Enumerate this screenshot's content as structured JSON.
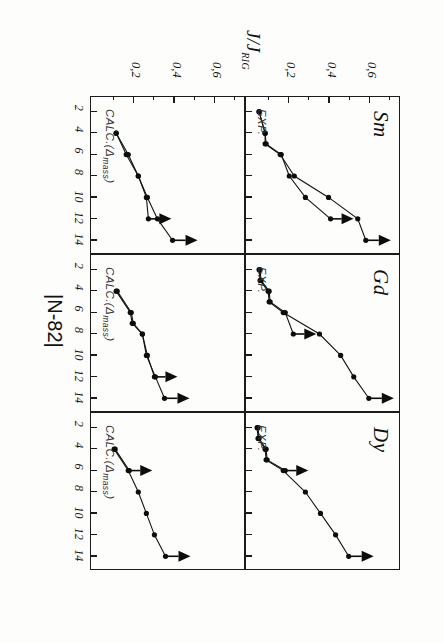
{
  "figure": {
    "rotation_degrees": 90,
    "ylabel": "J/J",
    "ylabel_sub": "RIG",
    "xlabel": "|N-82|",
    "row_labels": [
      "EXP.",
      "CALC.(Δmass)"
    ],
    "calc_label_main": "CALC.(Δ",
    "calc_label_sub": "mass",
    "calc_label_tail": ")",
    "exp_label": "EXP."
  },
  "chart_data": {
    "type": "line",
    "title": "",
    "xlabel": "|N-82|",
    "ylabel": "J/J_RIG",
    "xlim": [
      1,
      15
    ],
    "ylim": [
      0,
      0.72
    ],
    "xticks": [
      2,
      4,
      6,
      8,
      10,
      12,
      14
    ],
    "xticklabels": [
      "2",
      "4",
      "6",
      "8",
      "10",
      "12",
      "14"
    ],
    "yticks": [
      0.2,
      0.4,
      0.6
    ],
    "yticklabels": [
      "0,2",
      "0,4",
      "0,6"
    ],
    "grid": false,
    "legend": "none",
    "panels": [
      {
        "id": "sm-exp",
        "row": "EXP.",
        "column": "Sm",
        "title": "Sm",
        "row_label": "EXP.",
        "series": [
          {
            "name": "upper-branch",
            "marker": "filled-circle",
            "arrow": "left",
            "x": [
              2,
              4,
              5,
              6,
              8,
              10,
              12,
              14
            ],
            "values": [
              0.055,
              0.085,
              0.085,
              0.16,
              0.23,
              0.4,
              0.545,
              0.585
            ]
          },
          {
            "name": "lower-branch",
            "marker": "filled-circle",
            "arrow": "right",
            "x": [
              2,
              4,
              5,
              6,
              8,
              10,
              12
            ],
            "values": [
              0.055,
              0.085,
              0.09,
              0.165,
              0.205,
              0.285,
              0.41
            ]
          }
        ]
      },
      {
        "id": "gd-exp",
        "row": "EXP.",
        "column": "Gd",
        "title": "Gd",
        "row_label": "EXP.",
        "series": [
          {
            "name": "upper-branch",
            "marker": "filled-circle",
            "arrow": "left",
            "x": [
              2,
              3,
              4,
              5,
              6,
              8,
              10,
              12,
              14
            ],
            "values": [
              0.055,
              0.06,
              0.1,
              0.105,
              0.175,
              0.355,
              0.46,
              0.525,
              0.6
            ]
          },
          {
            "name": "lower-branch",
            "marker": "filled-circle",
            "arrow": "right",
            "x": [
              2,
              3,
              4,
              5,
              6,
              8
            ],
            "values": [
              0.06,
              0.065,
              0.105,
              0.11,
              0.185,
              0.225
            ]
          }
        ]
      },
      {
        "id": "dy-exp",
        "row": "EXP.",
        "column": "Dy",
        "title": "Dy",
        "row_label": "EXP.",
        "series": [
          {
            "name": "upper-branch",
            "marker": "filled-circle",
            "arrow": "left",
            "x": [
              2,
              3,
              4,
              5,
              6,
              8,
              10,
              12,
              14
            ],
            "values": [
              0.045,
              0.05,
              0.085,
              0.09,
              0.175,
              0.285,
              0.36,
              0.435,
              0.5
            ]
          },
          {
            "name": "lower-branch",
            "marker": "filled-circle",
            "arrow": "right",
            "x": [
              2,
              3,
              4,
              5,
              6
            ],
            "values": [
              0.05,
              0.055,
              0.09,
              0.095,
              0.185
            ]
          }
        ]
      },
      {
        "id": "sm-calc",
        "row": "CALC.(Δmass)",
        "column": "Sm",
        "title": "",
        "row_label": "CALC.(Δmass)",
        "series": [
          {
            "name": "upper-branch",
            "marker": "filled-circle",
            "arrow": "left",
            "x": [
              4,
              6,
              8,
              10,
              12,
              14
            ],
            "values": [
              0.115,
              0.165,
              0.225,
              0.27,
              0.32,
              0.395
            ]
          },
          {
            "name": "lower-branch",
            "marker": "filled-circle",
            "arrow": "right",
            "x": [
              4,
              6,
              8,
              10,
              12
            ],
            "values": [
              0.115,
              0.175,
              0.225,
              0.265,
              0.275
            ]
          }
        ]
      },
      {
        "id": "gd-calc",
        "row": "CALC.(Δmass)",
        "column": "Gd",
        "title": "",
        "row_label": "CALC.(Δmass)",
        "series": [
          {
            "name": "upper-branch",
            "marker": "filled-circle",
            "arrow": "left",
            "x": [
              4,
              6,
              7,
              8,
              10,
              12,
              14
            ],
            "values": [
              0.115,
              0.185,
              0.195,
              0.245,
              0.265,
              0.31,
              0.355
            ]
          },
          {
            "name": "lower-branch",
            "marker": "filled-circle",
            "arrow": "right",
            "x": [
              4,
              6,
              7,
              8,
              10,
              12
            ],
            "values": [
              0.12,
              0.19,
              0.2,
              0.245,
              0.27,
              0.305
            ]
          }
        ]
      },
      {
        "id": "dy-calc",
        "row": "CALC.(Δmass)",
        "column": "Dy",
        "title": "",
        "row_label": "CALC.(Δmass)",
        "series": [
          {
            "name": "upper-branch",
            "marker": "filled-circle",
            "arrow": "left",
            "x": [
              4,
              6,
              8,
              10,
              12,
              14
            ],
            "values": [
              0.105,
              0.175,
              0.225,
              0.265,
              0.305,
              0.36
            ]
          },
          {
            "name": "lower-branch",
            "marker": "filled-circle",
            "arrow": "right",
            "x": [
              4,
              6
            ],
            "values": [
              0.11,
              0.18
            ]
          }
        ]
      }
    ]
  },
  "panel_titles": {
    "sm": "Sm",
    "gd": "Gd",
    "dy": "Dy"
  },
  "ticks": {
    "x": [
      "2",
      "4",
      "6",
      "8",
      "10",
      "12",
      "14"
    ],
    "y": [
      "0,2",
      "0,4",
      "0,6"
    ]
  }
}
